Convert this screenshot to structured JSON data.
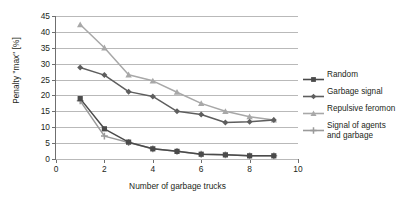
{
  "chart_data": {
    "type": "line",
    "title": "",
    "xlabel": "Number of garbage trucks",
    "ylabel": "Penalty \"max\" [%]",
    "xlim": [
      0,
      10
    ],
    "ylim": [
      0,
      45
    ],
    "xticks": [
      0,
      2,
      4,
      6,
      8,
      10
    ],
    "yticks": [
      0,
      5,
      10,
      15,
      20,
      25,
      30,
      35,
      40,
      45
    ],
    "grid": true,
    "legend_position": "right",
    "x": [
      1,
      2,
      3,
      4,
      5,
      6,
      7,
      8,
      9
    ],
    "series": [
      {
        "name": "Random",
        "color": "#4a4a4a",
        "marker": "square",
        "values": [
          19.0,
          9.5,
          5.3,
          3.2,
          2.4,
          1.5,
          1.3,
          1.0,
          1.0
        ]
      },
      {
        "name": "Garbage signal",
        "color": "#5e5e5e",
        "marker": "diamond",
        "values": [
          28.8,
          26.4,
          21.2,
          19.7,
          15.0,
          14.0,
          11.5,
          11.7,
          12.3
        ]
      },
      {
        "name": "Repulsive feromon",
        "color": "#a8a8a8",
        "marker": "triangle",
        "values": [
          42.3,
          35.0,
          26.5,
          24.6,
          21.0,
          17.5,
          15.0,
          13.3,
          12.3
        ]
      },
      {
        "name": "Signal of agents and garbage",
        "color": "#9a9a9a",
        "marker": "cross",
        "values": [
          18.3,
          7.2,
          5.2,
          3.2,
          2.4,
          1.5,
          1.3,
          1.0,
          1.0
        ]
      }
    ]
  },
  "axis": {
    "y_tick_labels": [
      "0",
      "5",
      "10",
      "15",
      "20",
      "25",
      "30",
      "35",
      "40",
      "45"
    ],
    "x_tick_labels": [
      "0",
      "2",
      "4",
      "6",
      "8",
      "10"
    ],
    "y_title": "Penalty \"max\" [%]",
    "x_title": "Number of garbage trucks"
  },
  "legend": {
    "items": [
      {
        "label": "Random",
        "color": "#4a4a4a",
        "marker": "square"
      },
      {
        "label": "Garbage signal",
        "color": "#5e5e5e",
        "marker": "diamond"
      },
      {
        "label": "Repulsive feromon",
        "color": "#a8a8a8",
        "marker": "triangle"
      },
      {
        "label": "Signal of agents\nand garbage",
        "color": "#9a9a9a",
        "marker": "cross"
      }
    ]
  },
  "colors": {
    "grid": "#b9b9b9",
    "axis": "#6f6f6f",
    "text": "#231f20",
    "background": "#ffffff"
  }
}
